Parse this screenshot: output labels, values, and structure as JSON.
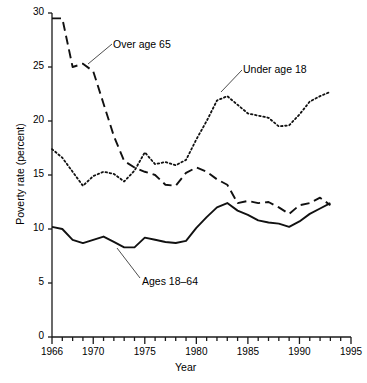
{
  "chart_data": {
    "type": "line",
    "title": "",
    "xlabel": "Year",
    "ylabel": "Poverty rate (percent)",
    "xlim": [
      1966,
      1995
    ],
    "ylim": [
      0,
      30
    ],
    "grid": false,
    "legend_position": "inline-annotations",
    "x_ticks_major": [
      1966,
      1970,
      1975,
      1980,
      1985,
      1990,
      1995
    ],
    "x_tick_labels": [
      "1966",
      "1970",
      "1975",
      "1980",
      "1985",
      "1990",
      "1995"
    ],
    "y_ticks": [
      0,
      5,
      10,
      15,
      20,
      25,
      30
    ],
    "y_tick_labels": [
      "0",
      "5",
      "10",
      "15",
      "20",
      "25",
      "30"
    ],
    "x": [
      1966,
      1967,
      1968,
      1969,
      1970,
      1971,
      1972,
      1973,
      1974,
      1975,
      1976,
      1977,
      1978,
      1979,
      1980,
      1981,
      1982,
      1983,
      1984,
      1985,
      1986,
      1987,
      1988,
      1989,
      1990,
      1991,
      1992,
      1993
    ],
    "series": [
      {
        "name": "Over age 65",
        "style": "dashed",
        "annotation": "Over age 65",
        "values": [
          29.5,
          29.5,
          25.0,
          25.3,
          24.6,
          21.6,
          18.6,
          16.3,
          15.7,
          15.3,
          15.0,
          14.1,
          14.0,
          15.2,
          15.7,
          15.3,
          14.6,
          14.1,
          12.4,
          12.6,
          12.4,
          12.5,
          12.0,
          11.4,
          12.2,
          12.4,
          12.9,
          12.2
        ]
      },
      {
        "name": "Under age 18",
        "style": "dotted",
        "annotation": "Under age 18",
        "values": [
          17.4,
          16.6,
          15.3,
          14.0,
          14.9,
          15.3,
          15.1,
          14.4,
          15.4,
          17.1,
          16.0,
          16.2,
          15.9,
          16.4,
          18.3,
          20.0,
          21.9,
          22.3,
          21.5,
          20.7,
          20.5,
          20.3,
          19.5,
          19.6,
          20.6,
          21.8,
          22.3,
          22.7
        ]
      },
      {
        "name": "Ages 18-64",
        "style": "solid",
        "annotation": "Ages 18–64",
        "values": [
          10.2,
          10.0,
          9.0,
          8.7,
          9.0,
          9.3,
          8.8,
          8.3,
          8.3,
          9.2,
          9.0,
          8.8,
          8.7,
          8.9,
          10.1,
          11.1,
          12.0,
          12.4,
          11.7,
          11.3,
          10.8,
          10.6,
          10.5,
          10.2,
          10.7,
          11.4,
          11.9,
          12.4
        ]
      }
    ]
  },
  "footnote": ""
}
